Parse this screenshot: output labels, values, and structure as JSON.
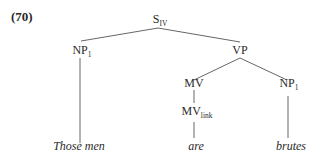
{
  "example_number": "(70)",
  "tree": {
    "root": {
      "label": "S",
      "sub": "IV"
    },
    "np1_left": {
      "label": "NP",
      "sub": "1"
    },
    "vp": {
      "label": "VP",
      "sub": ""
    },
    "mv": {
      "label": "MV",
      "sub": ""
    },
    "np1_right": {
      "label": "NP",
      "sub": "1"
    },
    "mv_link": {
      "label": "MV",
      "sub": "link"
    }
  },
  "leaves": {
    "subject": "Those men",
    "verb": "are",
    "complement": "brutes"
  },
  "colors": {
    "line": "#555555",
    "text": "#2a2a2a"
  }
}
